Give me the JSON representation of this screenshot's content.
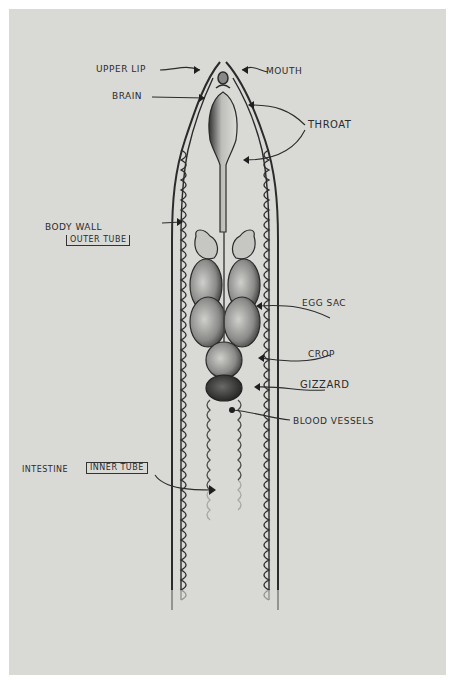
{
  "diagram": {
    "colors": {
      "paper": "#d9d9d6",
      "border": "#ffffff",
      "ink": "#2b2b2b"
    },
    "labels": {
      "upper_lip": "Upper Lip",
      "mouth": "Mouth",
      "brain": "Brain",
      "throat": "Throat",
      "body_wall": "Body Wall",
      "body_wall_note": "Outer Tube",
      "egg_sac": "Egg Sac",
      "crop": "Crop",
      "gizzard": "Gizzard",
      "blood_vessels": "Blood Vessels",
      "intestine": "Intestine",
      "intestine_note": "Inner Tube"
    }
  }
}
